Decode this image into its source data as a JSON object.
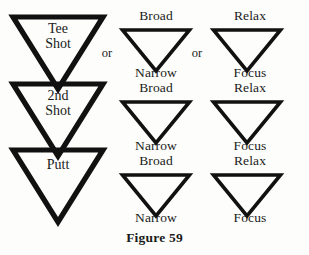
{
  "figure": {
    "caption": "Figure 59",
    "background_color": "#fdfdfb",
    "ink_color": "#111111"
  },
  "connectors": {
    "or_1": "or",
    "or_2": "or"
  },
  "columns": {
    "stages": {
      "name": "golf-stages",
      "triangles": [
        {
          "inner_label": "Tee\nShot"
        },
        {
          "inner_label": "2nd\nShot"
        },
        {
          "inner_label": "Putt"
        }
      ]
    },
    "attention_width": {
      "name": "attention-width",
      "triangles": [
        {
          "top_label": "Broad",
          "bottom_label": "Narrow"
        },
        {
          "top_label": "Broad",
          "bottom_label": "Narrow"
        },
        {
          "top_label": "Broad",
          "bottom_label": "Narrow"
        }
      ]
    },
    "attention_state": {
      "name": "attention-state",
      "triangles": [
        {
          "top_label": "Relax",
          "bottom_label": "Focus"
        },
        {
          "top_label": "Relax",
          "bottom_label": "Focus"
        },
        {
          "top_label": "Relax",
          "bottom_label": "Focus"
        }
      ]
    }
  }
}
